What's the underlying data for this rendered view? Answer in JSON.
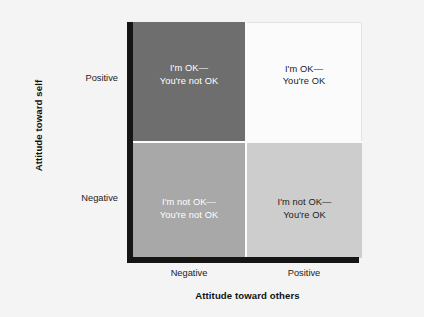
{
  "figure": {
    "background_color": "#f4f4f4"
  },
  "chart_data": {
    "type": "table",
    "title": "",
    "xlabel": "Attitude toward others",
    "ylabel": "Attitude toward self",
    "x_tick_labels": [
      "Negative",
      "Positive"
    ],
    "y_tick_labels": [
      "Positive",
      "Negative"
    ],
    "grid": false,
    "legend": "none",
    "quadrants": [
      {
        "id": "top-left",
        "x": "Negative",
        "y": "Positive",
        "label": "I'm OK—\nYou're not OK",
        "fill": "#6e6e6e",
        "text_color": "#ffffff"
      },
      {
        "id": "top-right",
        "x": "Positive",
        "y": "Positive",
        "label": "I'm OK—\nYou're OK",
        "fill": "#fbfbfb",
        "text_color": "#1b1b1b"
      },
      {
        "id": "bottom-left",
        "x": "Negative",
        "y": "Negative",
        "label": "I'm not OK—\nYou're not OK",
        "fill": "#a8a8a8",
        "text_color": "#ffffff"
      },
      {
        "id": "bottom-right",
        "x": "Positive",
        "y": "Negative",
        "label": "I'm not OK—\nYou're OK",
        "fill": "#cdcdcd",
        "text_color": "#1b1b1b"
      }
    ]
  }
}
